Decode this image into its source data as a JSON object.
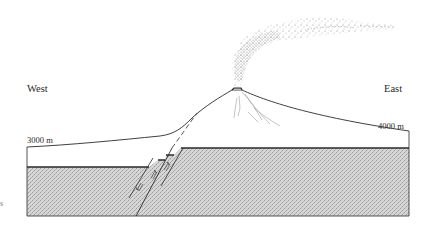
{
  "diagram": {
    "type": "geologic cross-section",
    "labels": {
      "west": "West",
      "east": "East",
      "elevation_west": "3000 m",
      "elevation_east": "4000 m",
      "edge_fragment": "s"
    },
    "elements": [
      "ground-surface-profile",
      "volcano-cone",
      "summit-crater",
      "eruption-plume",
      "bedrock-layer-stippled",
      "normal-faults-with-slip-arrows",
      "dashed-fault-projection"
    ],
    "colors": {
      "line": "#2a2a2a",
      "bedrock_fill": "#c9c9c9",
      "stipple": "#9a9a9a",
      "plume": "#8a8a8a",
      "background": "#ffffff"
    }
  }
}
